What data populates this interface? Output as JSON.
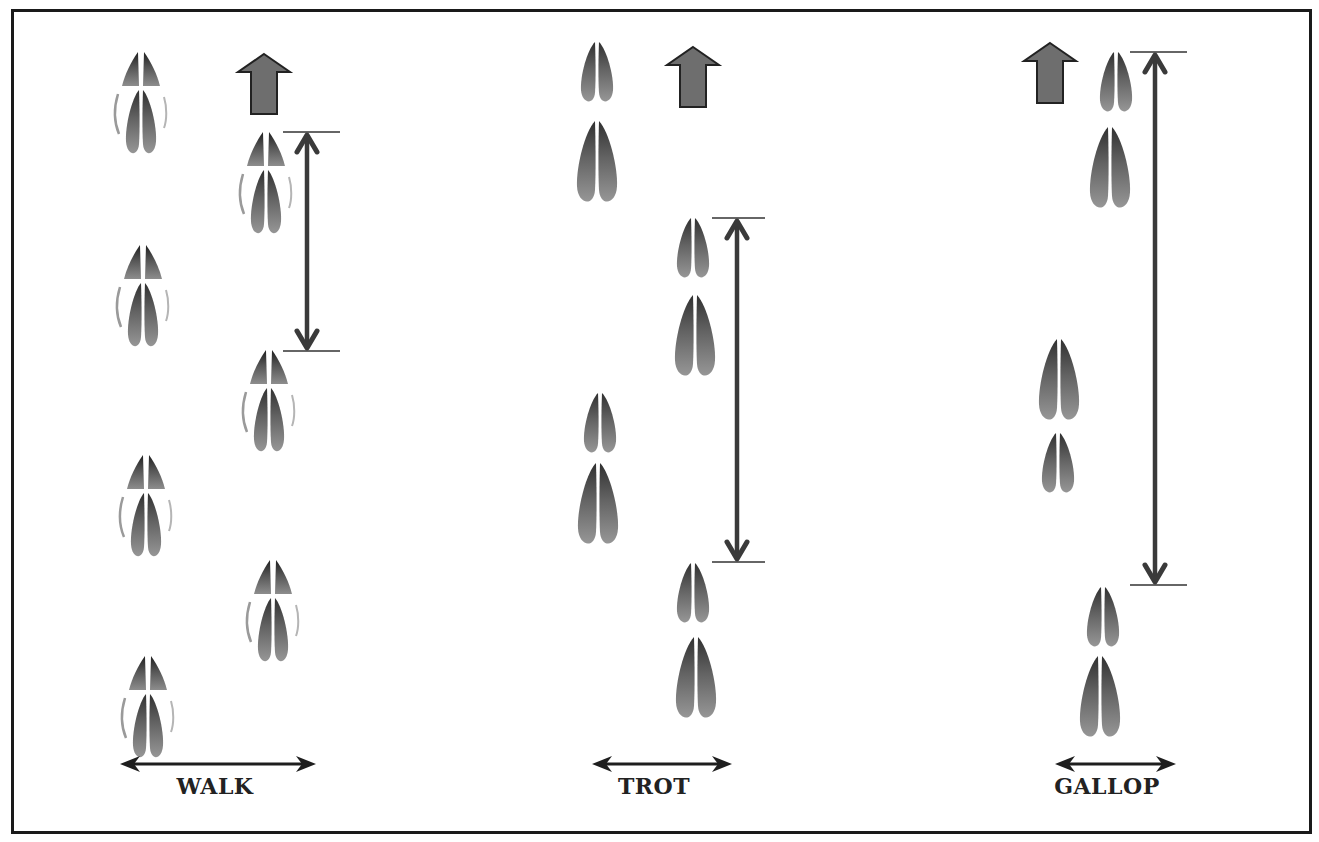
{
  "diagram": {
    "colors": {
      "border": "#1a1a1a",
      "print_dark": "#2b2b2b",
      "print_light": "#8a8a8a",
      "direction_arrow_fill": "#6e6e6e",
      "stride_arrow": "#3a3a3a",
      "label": "#222222"
    },
    "gaits": [
      {
        "name": "walk",
        "label": "WALK",
        "label_x": 215,
        "width_arrow": {
          "x1": 120,
          "x2": 316,
          "y": 764
        },
        "direction_arrow": {
          "cx": 264,
          "top": 54
        },
        "stride_arrow": {
          "x": 307,
          "y1": 132,
          "y2": 351,
          "tick_x1": 283,
          "tick_x2": 340
        },
        "prints": [
          {
            "type": "split",
            "cx": 141,
            "y": 52
          },
          {
            "type": "split",
            "cx": 266,
            "y": 132
          },
          {
            "type": "split",
            "cx": 143,
            "y": 245
          },
          {
            "type": "split",
            "cx": 269,
            "y": 350
          },
          {
            "type": "split",
            "cx": 146,
            "y": 455
          },
          {
            "type": "split",
            "cx": 273,
            "y": 560
          },
          {
            "type": "split",
            "cx": 148,
            "y": 656
          }
        ]
      },
      {
        "name": "trot",
        "label": "TROT",
        "label_x": 654,
        "width_arrow": {
          "x1": 592,
          "x2": 732,
          "y": 764
        },
        "direction_arrow": {
          "cx": 693,
          "top": 47
        },
        "stride_arrow": {
          "x": 737,
          "y1": 218,
          "y2": 562,
          "tick_x1": 712,
          "tick_x2": 765
        },
        "prints": [
          {
            "type": "small",
            "cx": 597,
            "y": 42
          },
          {
            "type": "large",
            "cx": 597,
            "y": 121
          },
          {
            "type": "small",
            "cx": 693,
            "y": 218
          },
          {
            "type": "large",
            "cx": 695,
            "y": 295
          },
          {
            "type": "small",
            "cx": 600,
            "y": 393
          },
          {
            "type": "large",
            "cx": 598,
            "y": 463
          },
          {
            "type": "small",
            "cx": 693,
            "y": 563
          },
          {
            "type": "large",
            "cx": 696,
            "y": 637
          }
        ]
      },
      {
        "name": "gallop",
        "label": "GALLOP",
        "label_x": 1107,
        "width_arrow": {
          "x1": 1055,
          "x2": 1176,
          "y": 764
        },
        "direction_arrow": {
          "cx": 1050,
          "top": 43
        },
        "stride_arrow": {
          "x": 1155,
          "y1": 52,
          "y2": 585,
          "tick_x1": 1130,
          "tick_x2": 1187
        },
        "prints": [
          {
            "type": "small",
            "cx": 1116,
            "y": 52
          },
          {
            "type": "large",
            "cx": 1110,
            "y": 127
          },
          {
            "type": "large",
            "cx": 1059,
            "y": 339
          },
          {
            "type": "small",
            "cx": 1058,
            "y": 433
          },
          {
            "type": "small",
            "cx": 1103,
            "y": 587
          },
          {
            "type": "large",
            "cx": 1100,
            "y": 656
          }
        ]
      }
    ]
  }
}
